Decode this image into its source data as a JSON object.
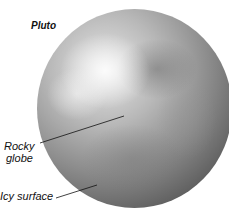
{
  "diagram": {
    "title": "Pluto",
    "labels": [
      {
        "id": "rocky-globe",
        "line1": "Rocky",
        "line2": "globe"
      },
      {
        "id": "icy-surface",
        "text": "Icy surface"
      }
    ],
    "colors": {
      "background": "#ffffff",
      "text": "#111111",
      "planet_highlight": "#e6e6e6",
      "planet_shadow": "#2e2e2e"
    }
  }
}
